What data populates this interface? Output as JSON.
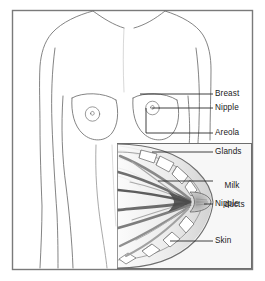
{
  "figure": {
    "frame": {
      "border_color": "#7a7a7a",
      "background": "#ffffff"
    },
    "colors": {
      "outline": "#6e6e6e",
      "label_text": "#1a1a1a",
      "leader_line": "#2b2b2b",
      "inset_border": "#6e6e6e",
      "inset_background": "#f7f7f7",
      "duct_dark": "#4a4a4a",
      "duct_mid": "#8d8d8d",
      "skin_shade": "#c9c9c9",
      "gland_fill": "#ffffff"
    }
  },
  "labels": [
    {
      "id": "breast",
      "text": "Breast",
      "x": 215,
      "y": 85,
      "lines": [
        "Breast"
      ]
    },
    {
      "id": "nipple_top",
      "text": "Nipple",
      "x": 215,
      "y": 104,
      "lines": [
        "Nipple"
      ]
    },
    {
      "id": "areola",
      "text": "Areola",
      "x": 215,
      "y": 128,
      "lines": [
        "Areola"
      ]
    },
    {
      "id": "glands",
      "text": "Glands",
      "x": 215,
      "y": 147,
      "lines": [
        "Glands"
      ]
    },
    {
      "id": "milk_ducts",
      "text": "Milk ducts",
      "x": 215,
      "y": 172,
      "lines": [
        "Milk",
        "ducts"
      ]
    },
    {
      "id": "nipple_inset",
      "text": "Nipple",
      "x": 215,
      "y": 200,
      "lines": [
        "Nipple"
      ]
    },
    {
      "id": "skin",
      "text": "Skin",
      "x": 215,
      "y": 237,
      "lines": [
        "Skin"
      ]
    }
  ],
  "label_text": {
    "breast": "Breast",
    "nipple_top": "Nipple",
    "areola": "Areola",
    "glands": "Glands",
    "milk_ducts_line1": "Milk",
    "milk_ducts_line2": "ducts",
    "nipple_inset": "Nipple",
    "skin": "Skin"
  },
  "anatomy": {
    "torso": {
      "description": "female upper torso front view, shoulders, arms, breasts, waist"
    },
    "inset": {
      "description": "breast cross-section showing glands, milk ducts, nipple and skin"
    }
  }
}
